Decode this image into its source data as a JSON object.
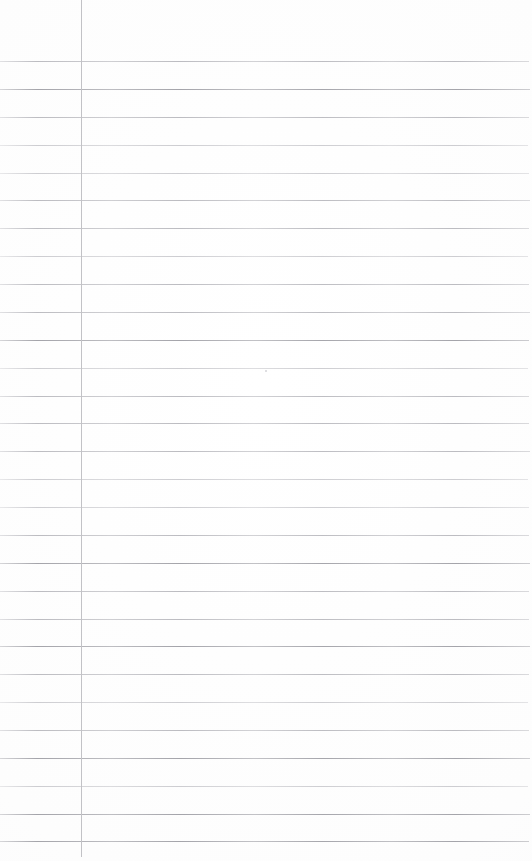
{
  "page": {
    "kind": "scanned-ruled-paper",
    "width": 532,
    "height": 861,
    "background_color": "#fefefe",
    "text_content": "",
    "visible_text_count": 0
  },
  "ruling": {
    "line_color": "#b9b9bd",
    "line_color_faint": "#cdcdd1",
    "line_color_strong": "#a4a4aa",
    "line_count": 29,
    "first_line_y": 61,
    "spacing": 27.86,
    "line_left_x": 0,
    "line_right_x": 529,
    "line_thickness": 1,
    "lines": [
      {
        "y": 61,
        "weight": "medium",
        "right": 529
      },
      {
        "y": 89,
        "weight": "strong",
        "right": 530
      },
      {
        "y": 117,
        "weight": "medium",
        "right": 529
      },
      {
        "y": 145,
        "weight": "faint",
        "right": 528
      },
      {
        "y": 173,
        "weight": "faint",
        "right": 529
      },
      {
        "y": 200,
        "weight": "medium",
        "right": 530
      },
      {
        "y": 228,
        "weight": "medium",
        "right": 529
      },
      {
        "y": 256,
        "weight": "faint",
        "right": 528
      },
      {
        "y": 284,
        "weight": "medium",
        "right": 529
      },
      {
        "y": 312,
        "weight": "medium",
        "right": 530
      },
      {
        "y": 340,
        "weight": "strong",
        "right": 529
      },
      {
        "y": 368,
        "weight": "faint",
        "right": 528
      },
      {
        "y": 396,
        "weight": "medium",
        "right": 529
      },
      {
        "y": 423,
        "weight": "medium",
        "right": 529
      },
      {
        "y": 451,
        "weight": "medium",
        "right": 530
      },
      {
        "y": 479,
        "weight": "faint",
        "right": 528
      },
      {
        "y": 507,
        "weight": "faint",
        "right": 529
      },
      {
        "y": 535,
        "weight": "medium",
        "right": 529
      },
      {
        "y": 563,
        "weight": "strong",
        "right": 530
      },
      {
        "y": 591,
        "weight": "medium",
        "right": 529
      },
      {
        "y": 619,
        "weight": "medium",
        "right": 529
      },
      {
        "y": 646,
        "weight": "strong",
        "right": 530
      },
      {
        "y": 674,
        "weight": "medium",
        "right": 529
      },
      {
        "y": 702,
        "weight": "faint",
        "right": 528
      },
      {
        "y": 730,
        "weight": "medium",
        "right": 529
      },
      {
        "y": 758,
        "weight": "strong",
        "right": 530
      },
      {
        "y": 786,
        "weight": "faint",
        "right": 528
      },
      {
        "y": 814,
        "weight": "strong",
        "right": 530
      },
      {
        "y": 841,
        "weight": "strong",
        "right": 529
      }
    ]
  },
  "margin_rule": {
    "label": "vertical-margin-line",
    "color": "#c2c2c6",
    "x": 81,
    "top_y": 0,
    "bottom_y": 857,
    "thickness": 1
  },
  "artifacts": {
    "stray_mark": {
      "x": 265,
      "y": 370,
      "color": "#a0a0a8"
    }
  }
}
